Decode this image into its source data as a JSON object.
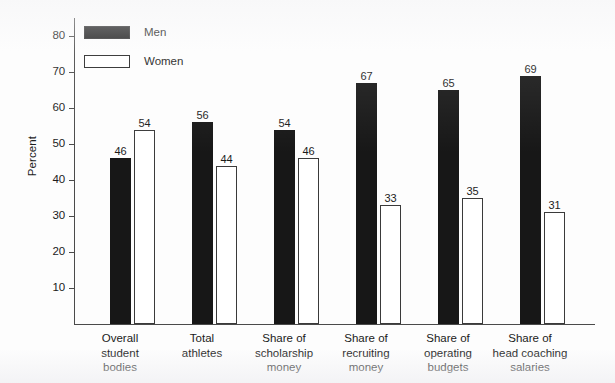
{
  "chart_data": {
    "type": "bar",
    "title": "",
    "xlabel": "",
    "ylabel": "Percent",
    "ylim": [
      0,
      85
    ],
    "grid": false,
    "legend_position": "top-left",
    "categories": [
      "Overall student bodies",
      "Total athletes",
      "Share of scholarship money",
      "Share of recruiting money",
      "Share of operating budgets",
      "Share of head coaching salaries"
    ],
    "category_lines": [
      [
        "Overall",
        "student",
        "bodies"
      ],
      [
        "Total",
        "athletes"
      ],
      [
        "Share of",
        "scholarship",
        "money"
      ],
      [
        "Share of",
        "recruiting",
        "money"
      ],
      [
        "Share of",
        "operating",
        "budgets"
      ],
      [
        "Share of",
        "head coaching",
        "salaries"
      ]
    ],
    "series": [
      {
        "name": "Men",
        "color": "#171717",
        "values": [
          46,
          56,
          54,
          67,
          65,
          69
        ]
      },
      {
        "name": "Women",
        "color": "#ffffff",
        "values": [
          54,
          44,
          46,
          33,
          35,
          31
        ]
      }
    ],
    "y_ticks": [
      10,
      20,
      30,
      40,
      50,
      60,
      70,
      80
    ],
    "y_tick_labels": [
      "10",
      "20",
      "30",
      "40",
      "50",
      "60",
      "70",
      "80"
    ]
  },
  "legend": {
    "items": [
      {
        "label": "Men",
        "swatch": "filled-black-swatch"
      },
      {
        "label": "Women",
        "swatch": "outlined-white-swatch"
      }
    ]
  },
  "axes": {
    "y_title": "Percent"
  },
  "caption": {
    "text": ""
  }
}
